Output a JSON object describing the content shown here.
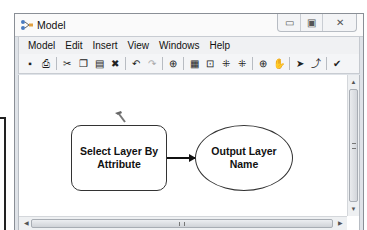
{
  "window": {
    "title": "Model",
    "controls": {
      "minimize": "minimize-icon",
      "maximize": "maximize-icon",
      "close": "close-icon"
    }
  },
  "menubar": {
    "items": [
      {
        "label": "Model"
      },
      {
        "label": "Edit"
      },
      {
        "label": "Insert"
      },
      {
        "label": "View"
      },
      {
        "label": "Windows"
      },
      {
        "label": "Help"
      }
    ]
  },
  "toolbar": {
    "buttons": [
      {
        "icon": "save-icon",
        "glyph": "▪"
      },
      {
        "icon": "print-icon",
        "glyph": "⎙"
      },
      {
        "icon": "cut-icon",
        "glyph": "✂"
      },
      {
        "icon": "copy-icon",
        "glyph": "❐"
      },
      {
        "icon": "paste-icon",
        "glyph": "▤"
      },
      {
        "icon": "delete-icon",
        "glyph": "✖"
      },
      {
        "icon": "undo-icon",
        "glyph": "↶"
      },
      {
        "icon": "redo-icon",
        "glyph": "↷"
      },
      {
        "icon": "add-data-icon",
        "glyph": "⊕"
      },
      {
        "icon": "auto-layout-icon",
        "glyph": "▦"
      },
      {
        "icon": "full-extent-icon",
        "glyph": "⊡"
      },
      {
        "icon": "fixed-zoom-in-icon",
        "glyph": "⁜"
      },
      {
        "icon": "fixed-zoom-out-icon",
        "glyph": "⁜"
      },
      {
        "icon": "zoom-in-icon",
        "glyph": "⊕"
      },
      {
        "icon": "pan-icon",
        "glyph": "✋"
      },
      {
        "icon": "select-icon",
        "glyph": "➤"
      },
      {
        "icon": "connect-icon",
        "glyph": "⤴"
      },
      {
        "icon": "validate-icon",
        "glyph": "✔"
      }
    ]
  },
  "diagram": {
    "tool_node": {
      "label": "Select Layer By Attribute",
      "shape": "rounded-rectangle"
    },
    "data_node": {
      "label": "Output Layer Name",
      "shape": "ellipse"
    },
    "connector": {
      "from": "Select Layer By Attribute",
      "to": "Output Layer Name"
    }
  }
}
